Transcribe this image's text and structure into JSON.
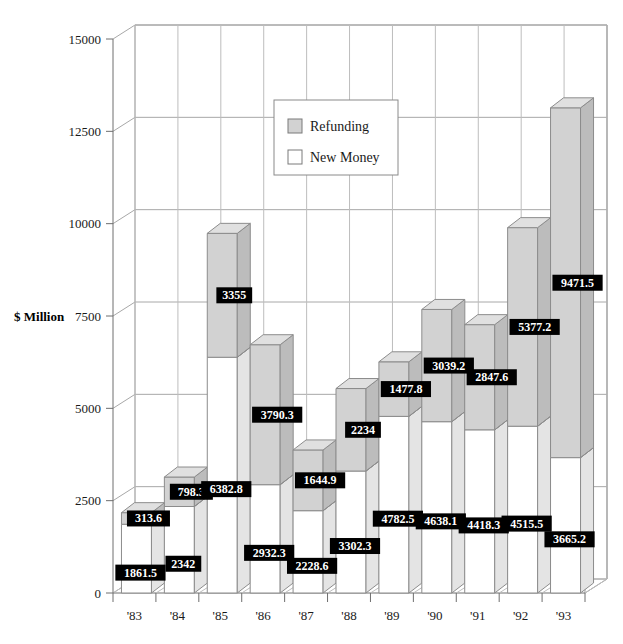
{
  "chart_data": {
    "type": "bar",
    "subtype": "stacked-3d-column",
    "title": "",
    "xlabel": "",
    "ylabel": "$ Million",
    "ylim": [
      0,
      15000
    ],
    "yticks": [
      0,
      2500,
      5000,
      7500,
      10000,
      12500,
      15000
    ],
    "ytick_labels": [
      "0",
      "2500",
      "5000",
      "7500",
      "10000",
      "12500",
      "15000"
    ],
    "grid": true,
    "legend_position": "top-center-inside",
    "categories": [
      "'83",
      "'84",
      "'85",
      "'86",
      "'87",
      "'88",
      "'89",
      "'90",
      "'91",
      "'92",
      "'93"
    ],
    "series": [
      {
        "name": "New Money",
        "color": "#ffffff",
        "values": [
          1861.5,
          2342,
          6382.8,
          2932.3,
          2228.6,
          3302.3,
          4782.5,
          4638.1,
          4418.3,
          4515.5,
          3665.2
        ],
        "labels": [
          "1861.5",
          "2342",
          "6382.8",
          "2932.3",
          "2228.6",
          "3302.3",
          "4782.5",
          "4638.1",
          "4418.3",
          "4515.5",
          "3665.2"
        ]
      },
      {
        "name": "Refunding",
        "color": "#d2d2d2",
        "values": [
          313.6,
          798.3,
          3355,
          3790.3,
          1644.9,
          2234,
          1477.8,
          3039.2,
          2847.6,
          5377.2,
          9471.5
        ],
        "labels": [
          "313.6",
          "798.3",
          "3355",
          "3790.3",
          "1644.9",
          "2234",
          "1477.8",
          "3039.2",
          "2847.6",
          "5377.2",
          "9471.5"
        ]
      }
    ],
    "totals": [
      2175.1,
      3140.3,
      9737.8,
      6722.6,
      3873.5,
      5536.3,
      6260.3,
      7677.3,
      7265.9,
      9892.7,
      13136.7
    ]
  },
  "legend": {
    "items": [
      {
        "label": "Refunding",
        "color": "#d2d2d2"
      },
      {
        "label": "New Money",
        "color": "#ffffff"
      }
    ]
  },
  "axes": {
    "y_title": "$ Million"
  },
  "colors": {
    "refunding_fill": "#d2d2d2",
    "refunding_top": "#e0e0e0",
    "refunding_side": "#bcbcbc",
    "new_money_fill": "#ffffff",
    "new_money_top": "#f2f2f2",
    "new_money_side": "#e4e4e4",
    "label_box": "#000000",
    "label_text": "#ffffff",
    "axis": "#6e6e6e",
    "grid": "#a8a8a8"
  }
}
